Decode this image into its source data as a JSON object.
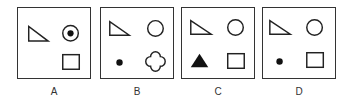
{
  "figure": {
    "type": "multiple-choice-shape-options",
    "stroke_color": "#222222",
    "options": [
      {
        "label": "A",
        "shapes": [
          "right-triangle-outline",
          "circle-with-center-dot",
          "square-outline"
        ]
      },
      {
        "label": "B",
        "shapes": [
          "right-triangle-outline",
          "circle-outline",
          "small-filled-dot",
          "quatrefoil-outline"
        ]
      },
      {
        "label": "C",
        "shapes": [
          "right-triangle-outline",
          "circle-outline",
          "filled-triangle",
          "square-outline"
        ]
      },
      {
        "label": "D",
        "shapes": [
          "right-triangle-outline",
          "circle-outline",
          "small-filled-dot",
          "square-outline"
        ]
      }
    ]
  }
}
